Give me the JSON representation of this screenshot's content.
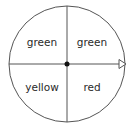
{
  "spinner": {
    "sections": [
      {
        "position": "top-left",
        "label": "green"
      },
      {
        "position": "top-right",
        "label": "green"
      },
      {
        "position": "bottom-left",
        "label": "yellow"
      },
      {
        "position": "bottom-right",
        "label": "red"
      }
    ],
    "pointer": "arrow pointing right from center",
    "stroke_color": "#555555"
  }
}
